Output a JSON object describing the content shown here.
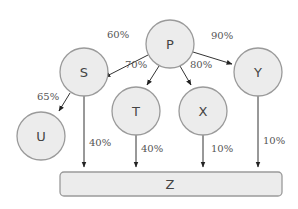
{
  "diagram": {
    "nodes": [
      {
        "id": "P",
        "label": "P"
      },
      {
        "id": "S",
        "label": "S"
      },
      {
        "id": "T",
        "label": "T"
      },
      {
        "id": "X",
        "label": "X"
      },
      {
        "id": "Y",
        "label": "Y"
      },
      {
        "id": "U",
        "label": "U"
      }
    ],
    "sink": {
      "id": "Z",
      "label": "Z"
    },
    "edges": [
      {
        "from": "P",
        "to": "S",
        "label": "60%"
      },
      {
        "from": "P",
        "to": "T",
        "label": "70%"
      },
      {
        "from": "P",
        "to": "X",
        "label": "80%"
      },
      {
        "from": "P",
        "to": "Y",
        "label": "90%"
      },
      {
        "from": "S",
        "to": "U",
        "label": "65%"
      },
      {
        "from": "S",
        "to": "Z",
        "label": "40%"
      },
      {
        "from": "T",
        "to": "Z",
        "label": "40%"
      },
      {
        "from": "X",
        "to": "Z",
        "label": "10%"
      },
      {
        "from": "Y",
        "to": "Z",
        "label": "10%"
      }
    ]
  }
}
